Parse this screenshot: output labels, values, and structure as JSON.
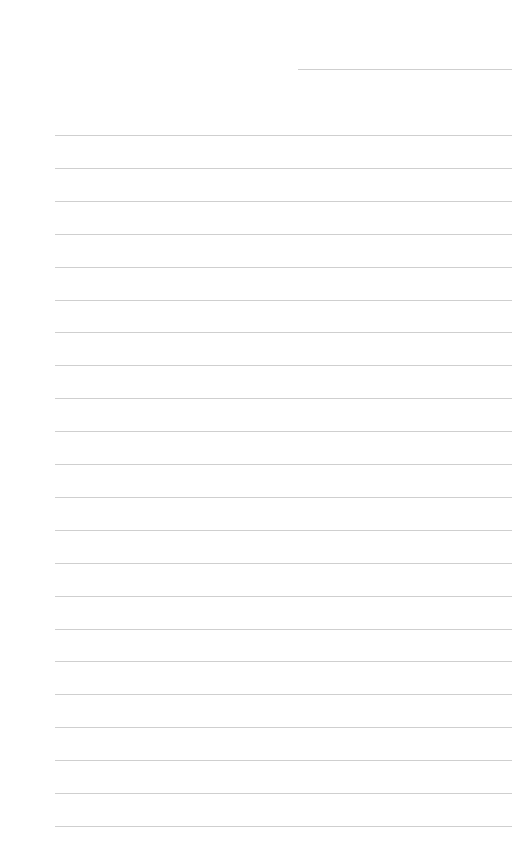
{
  "page": {
    "type": "lined-paper",
    "background": "#ffffff",
    "line_color": "#cfcfcf",
    "header_ghost_text": "",
    "short_line": {
      "top": 69,
      "left": 298,
      "width": 214
    },
    "lines": {
      "count": 22,
      "first_top": 135,
      "spacing": 32.9,
      "left": 55,
      "width": 457
    }
  }
}
